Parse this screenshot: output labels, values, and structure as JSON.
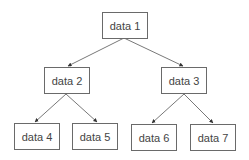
{
  "diagram": {
    "type": "binary-tree",
    "nodes": [
      {
        "id": "n1",
        "label": "data 1"
      },
      {
        "id": "n2",
        "label": "data 2"
      },
      {
        "id": "n3",
        "label": "data 3"
      },
      {
        "id": "n4",
        "label": "data 4"
      },
      {
        "id": "n5",
        "label": "data 5"
      },
      {
        "id": "n6",
        "label": "data 6"
      },
      {
        "id": "n7",
        "label": "data 7"
      }
    ],
    "edges": [
      {
        "from": "data 1",
        "to": "data 2"
      },
      {
        "from": "data 1",
        "to": "data 3"
      },
      {
        "from": "data 2",
        "to": "data 4"
      },
      {
        "from": "data 2",
        "to": "data 5"
      },
      {
        "from": "data 3",
        "to": "data 6"
      },
      {
        "from": "data 3",
        "to": "data 7"
      }
    ],
    "colors": {
      "border": "#6a6a6a",
      "edge": "#555555",
      "text": "#444444",
      "background": "#ffffff"
    }
  }
}
